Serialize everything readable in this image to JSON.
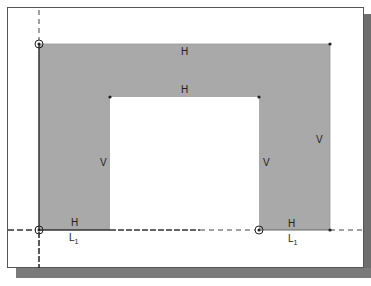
{
  "sketch": {
    "constraint_labels": {
      "outer_top": "H",
      "inner_top": "H",
      "left_leg_inner": "V",
      "right_leg_inner": "V",
      "right_outer": "V",
      "left_bottom": "H",
      "right_bottom": "H",
      "left_line_ref": "L",
      "left_line_sub": "1",
      "right_line_ref": "L",
      "right_line_sub": "1"
    },
    "colors": {
      "fill": "#a9a9a9",
      "outline": "#333333",
      "background": "#ffffff"
    }
  }
}
